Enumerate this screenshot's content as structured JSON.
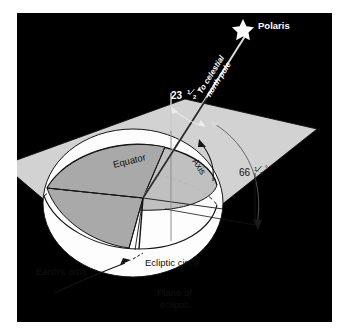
{
  "figure": {
    "panel_background": "#000000",
    "page_background": "#ffffff"
  },
  "colors": {
    "panel": "#000000",
    "plane_fill": "#d2d2d2",
    "plane_edge": "#1a1a1a",
    "sphere_fill": "#fdfdfd",
    "wedge_fill": "#a9a9a9",
    "equator_band_fill": "#bdbdbd",
    "line_dark": "#141414",
    "line_light": "#f2f2f2",
    "label_dark": "#101010",
    "label_light": "#ffffff",
    "star_fill": "#ffffff"
  },
  "labels": {
    "polaris": "Polaris",
    "to_celestial_north_pole_line1": "To celestial",
    "to_celestial_north_pole_line2": "north pole",
    "angle_tilt": "23 1/2°",
    "angle_tilt_num": "23",
    "angle_tilt_frac_top": "1",
    "angle_tilt_frac_bot": "2",
    "angle_tilt_deg": "°",
    "angle_complement_num": "66",
    "angle_complement_frac_top": "1",
    "angle_complement_frac_bot": "2",
    "angle_complement_deg": "°",
    "equator": "Equator",
    "axis": "Axis",
    "ecliptic_circle": "Ecliptic circle",
    "earths_orbit": "Earth's orbit",
    "plane_of_ecliptic_line1": "Plane of",
    "plane_of_ecliptic_line2": "ecliptic"
  },
  "icons": {
    "star": "star-icon",
    "arrow_orbit": "curved-arrow-icon",
    "arrow_tilt": "double-headed-arc-arrow-icon",
    "arrow_complement": "arc-arrow-icon",
    "arrow_pointer": "curved-pointer-arrow-icon"
  },
  "geometry": {
    "plane_points": "3,160 183,98 312,128 133,270",
    "axis_top_x": 245,
    "axis_top_y": 30,
    "axis_bottom_x": 139,
    "axis_bottom_y": 247,
    "vertical_ref_top_y": 93,
    "vertical_ref_x": 171,
    "sphere_center_x": 133,
    "sphere_center_y": 203
  }
}
